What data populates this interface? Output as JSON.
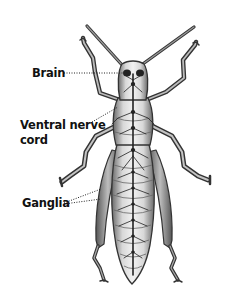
{
  "figure": {
    "background": "#ffffff",
    "ink_color": "#1a1a1a",
    "labels": [
      {
        "id": "brain",
        "lines": [
          "Brain"
        ],
        "x": 32,
        "y": 66
      },
      {
        "id": "ventral-nerve-cord",
        "lines": [
          "Ventral nerve",
          "cord"
        ],
        "x": 20,
        "y": 118
      },
      {
        "id": "ganglia",
        "lines": [
          "Ganglia"
        ],
        "x": 22,
        "y": 196
      }
    ],
    "leaders": [
      {
        "label": "brain",
        "from": [
          64,
          73
        ],
        "to": [
          128,
          73
        ]
      },
      {
        "label": "ventral-nerve-cord",
        "from": [
          92,
          122
        ],
        "to": [
          118,
          107
        ]
      },
      {
        "label": "ganglia",
        "from": [
          64,
          203
        ],
        "to": [
          101,
          189
        ]
      },
      {
        "label": "ganglia",
        "from": [
          64,
          204
        ],
        "to": [
          101,
          199
        ]
      }
    ]
  },
  "text": {
    "brain": "Brain",
    "vnc_line1": "Ventral nerve",
    "vnc_line2": "cord",
    "ganglia": "Ganglia"
  }
}
